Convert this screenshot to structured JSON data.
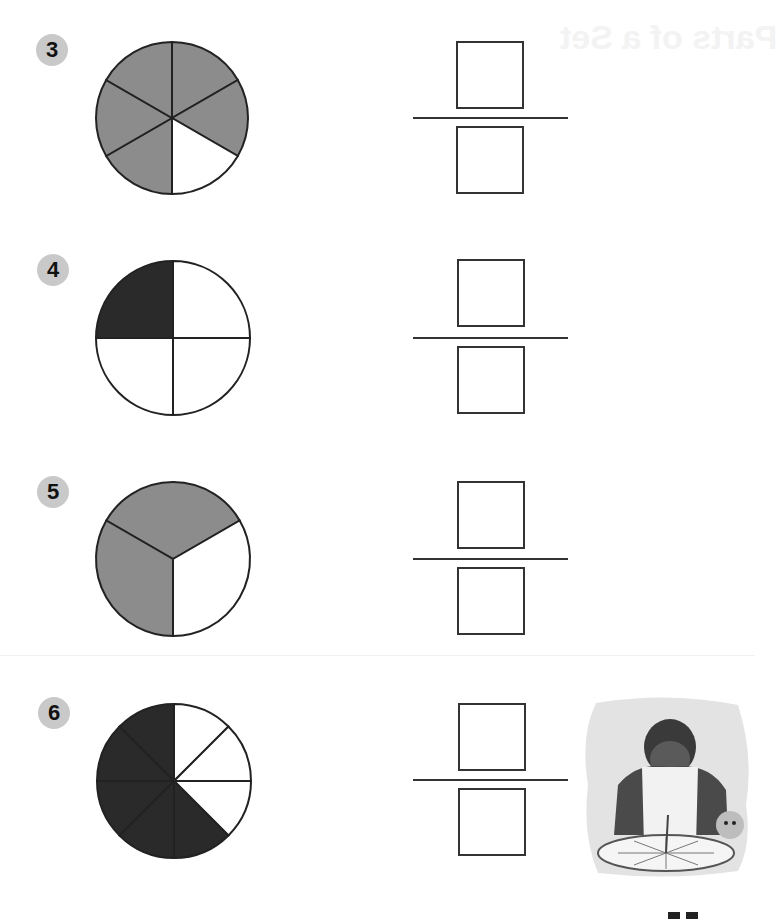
{
  "page": {
    "ghost_text": "Parts of a Set",
    "colors": {
      "gray_fill": "#8c8c8c",
      "dark_fill": "#2a2a2a",
      "outline": "#222222",
      "badge": "#c9c9c9"
    }
  },
  "problems": [
    {
      "number": "3",
      "slices": 6,
      "shaded": [
        0,
        1,
        3,
        4,
        5
      ],
      "fill": "gray",
      "badge": {
        "x": 36,
        "y": 34
      },
      "pie": {
        "cx": 172,
        "cy": 118,
        "r": 76
      },
      "numerator_box": {
        "x": 456,
        "y": 41
      },
      "bar_y": 117,
      "denominator_box": {
        "x": 456,
        "y": 126
      },
      "numerator": "",
      "denominator": ""
    },
    {
      "number": "4",
      "slices": 4,
      "shaded": [
        3
      ],
      "fill": "dark",
      "badge": {
        "x": 37,
        "y": 254
      },
      "pie": {
        "cx": 173,
        "cy": 338,
        "r": 77
      },
      "numerator_box": {
        "x": 457,
        "y": 259
      },
      "bar_y": 337,
      "denominator_box": {
        "x": 457,
        "y": 346
      },
      "numerator": "",
      "denominator": ""
    },
    {
      "number": "5",
      "slices": 3,
      "shaded": [
        0,
        2
      ],
      "fill": "gray",
      "rotate": -60,
      "badge": {
        "x": 37,
        "y": 476
      },
      "pie": {
        "cx": 173,
        "cy": 559,
        "r": 77
      },
      "numerator_box": {
        "x": 457,
        "y": 481
      },
      "bar_y": 558,
      "denominator_box": {
        "x": 457,
        "y": 567
      },
      "numerator": "",
      "denominator": ""
    },
    {
      "number": "6",
      "slices": 8,
      "shaded": [
        3,
        4,
        5,
        6,
        7
      ],
      "fill": "dark",
      "badge": {
        "x": 38,
        "y": 697
      },
      "pie": {
        "cx": 174,
        "cy": 781,
        "r": 77
      },
      "numerator_box": {
        "x": 458,
        "y": 703
      },
      "bar_y": 779,
      "denominator_box": {
        "x": 458,
        "y": 788
      },
      "numerator": "",
      "denominator": ""
    }
  ],
  "illustration": {
    "description": "Boy in apron cutting a pie into 8 slices, with a puppy"
  },
  "page_number": ""
}
